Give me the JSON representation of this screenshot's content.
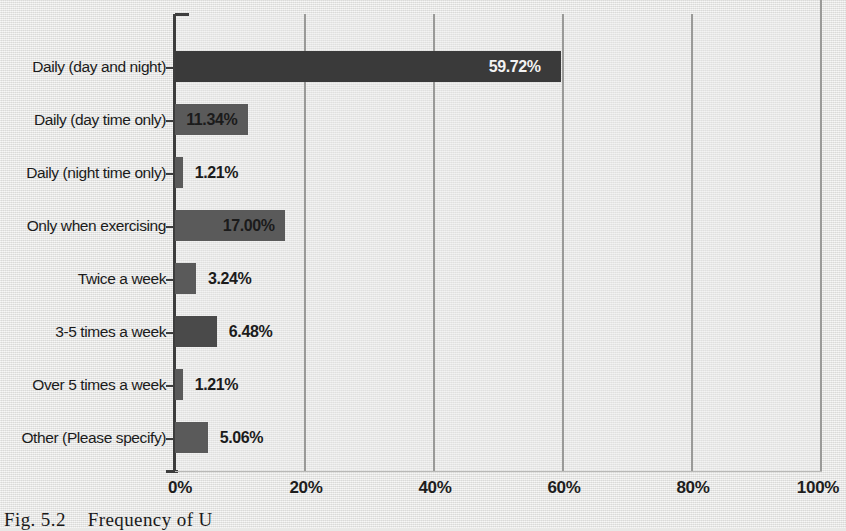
{
  "figure": {
    "caption": "Fig. 5.2",
    "caption_text": "Frequency of U",
    "background_color": "#e9e9e7"
  },
  "chart_data": {
    "type": "bar",
    "orientation": "horizontal",
    "title": "",
    "subtitle": "",
    "xlabel": "",
    "ylabel": "",
    "xlim": [
      0,
      100
    ],
    "ylim": null,
    "grid": true,
    "legend_position": "none",
    "xticks": [
      "0%",
      "20%",
      "40%",
      "60%",
      "80%",
      "100%"
    ],
    "xtick_values": [
      0,
      20,
      40,
      60,
      80,
      100
    ],
    "categories": [
      "Daily (day and night)",
      "Daily (day time only)",
      "Daily (night time only)",
      "Only when exercising",
      "Twice a week",
      "3-5 times a week",
      "Over 5 times a week",
      "Other (Please specify)"
    ],
    "values": [
      59.72,
      11.34,
      1.21,
      17.0,
      3.24,
      6.48,
      1.21,
      5.06
    ],
    "data_labels": [
      "59.72%",
      "11.34%",
      "1.21%",
      "17.00%",
      "3.24%",
      "6.48%",
      "1.21%",
      "5.06%"
    ],
    "label_placement": [
      "inside-light",
      "inside-dark",
      "outside",
      "inside-dark",
      "outside",
      "outside",
      "outside",
      "outside"
    ],
    "bar_colors": [
      "#3a3a3a",
      "#5a5a5a",
      "#5a5a5a",
      "#5a5a5a",
      "#5a5a5a",
      "#4a4a4a",
      "#5a5a5a",
      "#5a5a5a"
    ]
  }
}
